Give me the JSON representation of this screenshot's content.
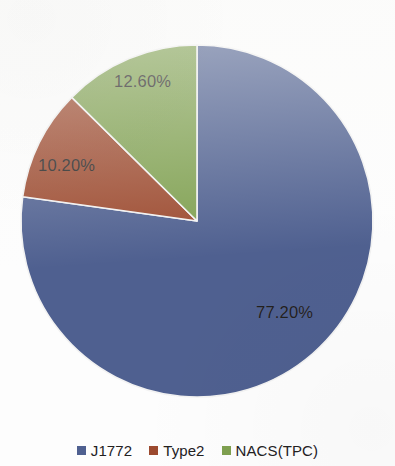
{
  "chart_data": {
    "type": "pie",
    "title": "",
    "subtitle": "",
    "xlabel": "",
    "ylabel": "",
    "grid": false,
    "legend_position": "bottom",
    "start_angle_deg": 0,
    "direction": "clockwise",
    "categories": [
      "J1772",
      "Type2",
      "NACS(TPC)"
    ],
    "values": [
      77.2,
      10.2,
      12.6
    ],
    "value_unit": "percent",
    "total": 100.0,
    "data_labels": [
      "77.20%",
      "10.20%",
      "12.60%"
    ],
    "colors": [
      "#4f6090",
      "#9c4a2f",
      "#7fa050"
    ],
    "slices": [
      {
        "label": "J1772",
        "value": 77.2,
        "data_label": "77.20%",
        "color": "#4f6090",
        "start_angle_deg": 0.0,
        "end_angle_deg": 277.92
      },
      {
        "label": "Type2",
        "value": 10.2,
        "data_label": "10.20%",
        "color": "#9c4a2f",
        "start_angle_deg": 277.92,
        "end_angle_deg": 314.64
      },
      {
        "label": "NACS(TPC)",
        "value": 12.6,
        "data_label": "12.60%",
        "color": "#7fa050",
        "start_angle_deg": 314.64,
        "end_angle_deg": 360.0
      }
    ]
  },
  "geometry": {
    "center_x": 197,
    "center_y": 221,
    "radius": 176,
    "separator_color": "#f2f2f2",
    "separator_width": 1.6
  },
  "legend": {
    "items": [
      {
        "label": "J1772",
        "color": "#4f6090"
      },
      {
        "label": "Type2",
        "color": "#9c4a2f"
      },
      {
        "label": "NACS(TPC)",
        "color": "#7fa050"
      }
    ]
  },
  "style": {
    "background": "#fdfdfd",
    "label_text_color": "#22201e"
  }
}
